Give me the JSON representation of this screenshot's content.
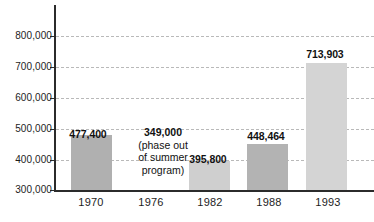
{
  "chart_data": {
    "type": "bar",
    "title": "",
    "subtitle": "",
    "xlabel": "",
    "ylabel": "",
    "categories": [
      "1970",
      "1976",
      "1982",
      "1988",
      "1993"
    ],
    "values": [
      477400,
      349000,
      395800,
      448464,
      713903
    ],
    "value_labels": [
      "477,400",
      "349,000",
      "395,800",
      "448,464",
      "713,903"
    ],
    "bar_rendered": [
      true,
      false,
      true,
      true,
      true
    ],
    "bar_colors": [
      "#b0b0b0",
      "",
      "#cfcfcf",
      "#b3b3b3",
      "#d4d4d4"
    ],
    "ylim": [
      300000,
      800000
    ],
    "yticks": [
      300000,
      400000,
      500000,
      600000,
      700000,
      800000
    ],
    "ytick_labels": [
      "300,000",
      "400,000",
      "500,000",
      "600,000",
      "700,000",
      "800,000"
    ],
    "grid": true,
    "grid_style": "dashed",
    "grid_color": "#b9b9b9",
    "legend": null,
    "annotations": [
      {
        "category": "1976",
        "value_label": "349,000",
        "lines": [
          "(phase out",
          "of summer",
          "program)"
        ]
      }
    ],
    "axis_color": "#2b2b2b",
    "background": "#ffffff"
  }
}
